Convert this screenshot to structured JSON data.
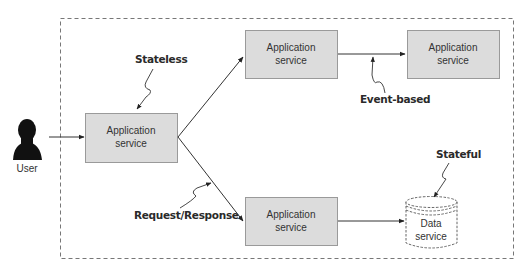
{
  "diagram": {
    "boundary": {
      "style": "dashed",
      "color": "#777777"
    },
    "colors": {
      "box_fill": "#dcdcdc",
      "box_stroke": "#9a9a9a",
      "line": "#333333"
    },
    "user": {
      "label": "User",
      "icon": "person-silhouette-icon"
    },
    "services": [
      {
        "id": "entry",
        "line1": "Application",
        "line2": "service"
      },
      {
        "id": "top-middle",
        "line1": "Application",
        "line2": "service"
      },
      {
        "id": "top-right",
        "line1": "Application",
        "line2": "service"
      },
      {
        "id": "bottom-middle",
        "line1": "Application",
        "line2": "service"
      }
    ],
    "data_service": {
      "line1": "Data",
      "line2": "service",
      "icon": "database-cylinder-icon"
    },
    "annotations": {
      "stateless": "Stateless",
      "event_based": "Event-based",
      "request_response": "Request/Response",
      "stateful": "Stateful"
    }
  }
}
